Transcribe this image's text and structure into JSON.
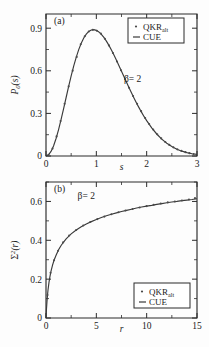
{
  "figure": {
    "title": "",
    "panels": [
      "a",
      "b"
    ]
  },
  "chart_data": [
    {
      "type": "line",
      "panel_label": "(a)",
      "title": "",
      "xlabel": "s",
      "ylabel": "P0(s)",
      "ylabel_parts": {
        "symbol": "P",
        "subscript": "0",
        "arg": "(s)"
      },
      "xlim": [
        0,
        3
      ],
      "ylim": [
        0,
        1.0
      ],
      "xticks": [
        0,
        1,
        2,
        3
      ],
      "xticklabels": [
        "0",
        "1",
        "2",
        "3"
      ],
      "yticks": [
        0,
        0.3,
        0.6,
        0.9
      ],
      "yticklabels": [
        "0",
        "0.3",
        "0.6",
        "0.9"
      ],
      "xminorticks": [
        0.5,
        1.5,
        2.5
      ],
      "yminorticks": [
        0.15,
        0.45,
        0.75,
        1.05
      ],
      "grid": false,
      "annotation": {
        "text": "β= 2",
        "x": 1.72,
        "y": 0.52
      },
      "legend": {
        "position": "top-right",
        "entries": [
          {
            "label": "QKR",
            "sublabel": "alt",
            "marker": "dot"
          },
          {
            "label": "CUE",
            "sublabel": "",
            "marker": "line"
          }
        ]
      },
      "series": [
        {
          "name": "CUE",
          "style": "line",
          "x": [
            0.0,
            0.05,
            0.1,
            0.15,
            0.2,
            0.25,
            0.3,
            0.35,
            0.4,
            0.45,
            0.5,
            0.55,
            0.6,
            0.65,
            0.7,
            0.75,
            0.8,
            0.85,
            0.9,
            0.95,
            1.0,
            1.05,
            1.1,
            1.15,
            1.2,
            1.25,
            1.3,
            1.35,
            1.4,
            1.45,
            1.5,
            1.55,
            1.6,
            1.65,
            1.7,
            1.75,
            1.8,
            1.85,
            1.9,
            1.95,
            2.0,
            2.1,
            2.2,
            2.3,
            2.4,
            2.5,
            2.6,
            2.7,
            2.8,
            2.9,
            3.0
          ],
          "y": [
            0.0,
            0.008,
            0.032,
            0.071,
            0.123,
            0.186,
            0.258,
            0.334,
            0.412,
            0.49,
            0.564,
            0.633,
            0.695,
            0.749,
            0.794,
            0.831,
            0.858,
            0.877,
            0.887,
            0.89,
            0.885,
            0.874,
            0.857,
            0.835,
            0.809,
            0.779,
            0.746,
            0.711,
            0.674,
            0.636,
            0.597,
            0.558,
            0.519,
            0.481,
            0.443,
            0.407,
            0.372,
            0.339,
            0.307,
            0.277,
            0.249,
            0.198,
            0.155,
            0.119,
            0.09,
            0.067,
            0.048,
            0.034,
            0.024,
            0.016,
            0.011
          ]
        },
        {
          "name": "QKR_alt",
          "style": "markers",
          "x": [
            0.05,
            0.13,
            0.21,
            0.29,
            0.37,
            0.45,
            0.53,
            0.61,
            0.69,
            0.77,
            0.85,
            0.93,
            1.01,
            1.09,
            1.17,
            1.25,
            1.33,
            1.41,
            1.49,
            1.57,
            1.65,
            1.73,
            1.81,
            1.89,
            1.97,
            2.05,
            2.13,
            2.21,
            2.29,
            2.37,
            2.45,
            2.53,
            2.61,
            2.69,
            2.77,
            2.85,
            2.93
          ],
          "y": [
            0.008,
            0.052,
            0.138,
            0.246,
            0.368,
            0.49,
            0.601,
            0.698,
            0.787,
            0.843,
            0.877,
            0.889,
            0.882,
            0.862,
            0.826,
            0.779,
            0.725,
            0.666,
            0.604,
            0.542,
            0.481,
            0.423,
            0.368,
            0.316,
            0.268,
            0.225,
            0.187,
            0.153,
            0.124,
            0.099,
            0.078,
            0.061,
            0.047,
            0.036,
            0.027,
            0.02,
            0.014
          ]
        }
      ]
    },
    {
      "type": "line",
      "panel_label": "(b)",
      "title": "",
      "xlabel": "r",
      "ylabel": "Sigma^2(r)",
      "ylabel_parts": {
        "symbol": "Σ",
        "superscript": "2",
        "arg": "(r)"
      },
      "xlim": [
        0,
        15
      ],
      "ylim": [
        0,
        0.7
      ],
      "xticks": [
        0,
        5,
        10,
        15
      ],
      "xticklabels": [
        "0",
        "5",
        "10",
        "15"
      ],
      "yticks": [
        0,
        0.2,
        0.4,
        0.6
      ],
      "yticklabels": [
        "0",
        "0.2",
        "0.4",
        "0.6"
      ],
      "xminorticks": [
        2.5,
        7.5,
        12.5
      ],
      "yminorticks": [
        0.1,
        0.3,
        0.5,
        0.7
      ],
      "grid": false,
      "annotation": {
        "text": "β= 2",
        "x": 4.0,
        "y": 0.615
      },
      "legend": {
        "position": "bottom-right",
        "entries": [
          {
            "label": "QKR",
            "sublabel": "alt",
            "marker": "dot"
          },
          {
            "label": "CUE",
            "sublabel": "",
            "marker": "line"
          }
        ]
      },
      "series": [
        {
          "name": "CUE",
          "style": "line",
          "x": [
            0.0,
            0.05,
            0.1,
            0.15,
            0.2,
            0.3,
            0.4,
            0.5,
            0.65,
            0.8,
            1.0,
            1.25,
            1.5,
            1.75,
            2.0,
            2.5,
            3.0,
            3.5,
            4.0,
            4.5,
            5.0,
            5.5,
            6.0,
            6.5,
            7.0,
            7.5,
            8.0,
            8.5,
            9.0,
            9.5,
            10.0,
            10.5,
            11.0,
            11.5,
            12.0,
            12.5,
            13.0,
            13.5,
            14.0,
            14.5,
            15.0
          ],
          "y": [
            0.0,
            0.048,
            0.087,
            0.118,
            0.144,
            0.185,
            0.216,
            0.241,
            0.272,
            0.297,
            0.323,
            0.351,
            0.373,
            0.391,
            0.407,
            0.433,
            0.453,
            0.47,
            0.484,
            0.496,
            0.507,
            0.517,
            0.526,
            0.534,
            0.541,
            0.548,
            0.554,
            0.56,
            0.566,
            0.571,
            0.576,
            0.58,
            0.585,
            0.589,
            0.593,
            0.597,
            0.6,
            0.604,
            0.607,
            0.61,
            0.614
          ]
        },
        {
          "name": "QKR_alt",
          "style": "markers",
          "x": [
            0.15,
            0.45,
            0.8,
            1.2,
            1.7,
            2.3,
            3.0,
            3.7,
            4.4,
            5.1,
            5.8,
            6.5,
            7.2,
            7.9,
            8.6,
            9.3,
            10.0,
            10.7,
            11.4,
            12.1,
            12.8,
            13.5,
            14.2,
            14.8
          ],
          "y": [
            0.118,
            0.233,
            0.297,
            0.346,
            0.389,
            0.425,
            0.453,
            0.476,
            0.494,
            0.509,
            0.522,
            0.534,
            0.544,
            0.553,
            0.561,
            0.569,
            0.576,
            0.583,
            0.589,
            0.595,
            0.6,
            0.605,
            0.61,
            0.617
          ]
        }
      ]
    }
  ]
}
